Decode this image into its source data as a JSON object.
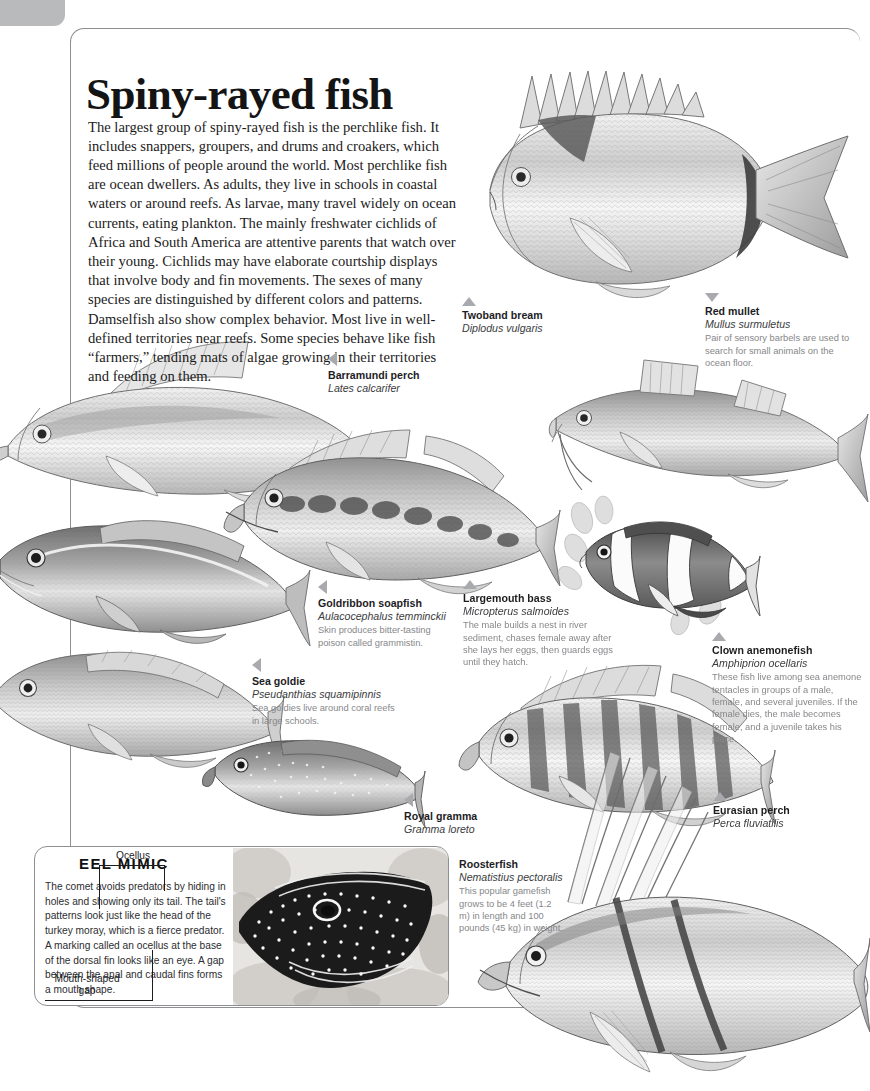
{
  "page": {
    "title": "Spiny-rayed fish",
    "intro": "The largest group of spiny-rayed fish is the perchlike fish. It includes snappers, groupers, and drums and croakers, which feed millions of people around the world. Most perchlike fish are ocean dwellers. As adults, they live in schools in coastal waters or around reefs. As larvae, many travel widely on ocean currents, eating plankton. The mainly freshwater cichlids of Africa and South America are attentive parents that watch over their young. Cichlids may have elaborate courtship displays that involve body and fin movements. The sexes of many species are distinguished by different colors and patterns. Damselfish also show complex behavior. Most live in well-defined territories near reefs. Some species behave like fish “farmers,” tending mats of algae growing in their territories and feeding on them."
  },
  "colors": {
    "rule": "#8d8f92",
    "tab": "#b9babc",
    "arrow": "#a9aaad",
    "caption_text": "#1d1d1f",
    "note_text": "#86878a",
    "ink": "#141414"
  },
  "specimens": [
    {
      "id": "twoband-bream",
      "common": "Twoband bream",
      "latin": "Diplodus vulgaris",
      "note": "",
      "arrow": "up"
    },
    {
      "id": "red-mullet",
      "common": "Red mullet",
      "latin": "Mullus surmuletus",
      "note": "Pair of sensory barbels are used to search for small animals on the ocean floor.",
      "arrow": "down"
    },
    {
      "id": "barramundi-perch",
      "common": "Barramundi perch",
      "latin": "Lates calcarifer",
      "note": "",
      "arrow": "left"
    },
    {
      "id": "goldribbon-soapfish",
      "common": "Goldribbon soapfish",
      "latin": "Aulacocephalus temminckii",
      "note": "Skin produces bitter-tasting poison called grammistin.",
      "arrow": "left"
    },
    {
      "id": "largemouth-bass",
      "common": "Largemouth bass",
      "latin": "Micropterus salmoides",
      "note": "The male builds a nest in river sediment, chases female away after she lays her eggs, then guards eggs until they hatch.",
      "arrow": "up"
    },
    {
      "id": "clown-anemonefish",
      "common": "Clown anemonefish",
      "latin": "Amphiprion ocellaris",
      "note": "These fish live among sea anemone tentacles in groups of a male, female, and several juveniles. If the female dies, the male becomes female, and a juvenile takes his place.",
      "arrow": "up"
    },
    {
      "id": "sea-goldie",
      "common": "Sea goldie",
      "latin": "Pseudanthias squamipinnis",
      "note": "Sea goldies live around coral reefs in large schools.",
      "arrow": "left"
    },
    {
      "id": "royal-gramma",
      "common": "Royal gramma",
      "latin": "Gramma loreto",
      "note": "",
      "arrow": "left"
    },
    {
      "id": "eurasian-perch",
      "common": "Eurasian perch",
      "latin": "Perca fluviatilis",
      "note": "",
      "arrow": "up"
    },
    {
      "id": "roosterfish",
      "common": "Roosterfish",
      "latin": "Nematistius pectoralis",
      "note": "This popular gamefish grows to be 4 feet (1.2 m) in length and 100 pounds (45 kg) in weight.",
      "arrow": "none"
    }
  ],
  "sidebar": {
    "title": "EEL MIMIC",
    "body": "The comet avoids predators by hiding in holes and showing only its tail. The tail's patterns look just like the head of the turkey moray, which is a fierce predator. A marking called an ocellus at the base of the dorsal fin looks like an eye. A gap between the anal and caudal fins forms a mouth shape.",
    "annotations": {
      "ocellus": "Ocellus",
      "mouth_gap": "Mouth-shaped gap"
    }
  }
}
